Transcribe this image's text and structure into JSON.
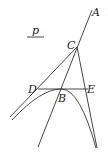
{
  "diagram": {
    "labels": {
      "A": "A",
      "C": "C",
      "D": "D",
      "B": "B",
      "E": "E",
      "p": "p"
    },
    "elements": [
      "line through A, C, B",
      "line from C through D",
      "line from C through E",
      "segment DE (tangent at B)",
      "parabola with vertex B",
      "parameter p with underline"
    ],
    "colors": {
      "stroke": "#333333",
      "background": "#ffffff"
    }
  }
}
